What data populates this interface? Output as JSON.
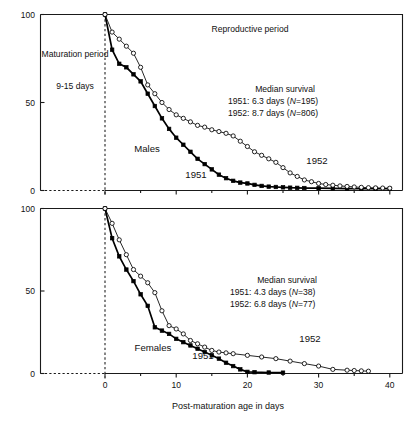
{
  "figure": {
    "x_axis_title": "Post-maturation age in days",
    "x_ticks": [
      "0",
      "10",
      "20",
      "30",
      "40"
    ],
    "y_ticks": [
      "100",
      "50",
      "0"
    ]
  },
  "panels": [
    {
      "id": "males",
      "sex_label": "Males",
      "region_left_label": "Maturation period",
      "region_left_sub": "9-15 days",
      "region_right_label": "Reproductive period",
      "stats_title": "Median survival",
      "stats_rows": [
        {
          "year": "1951:",
          "value": "6.3 days (",
          "n_italic": "N",
          "n_rest": "=195)"
        },
        {
          "year": "1952:",
          "value": "8.7 days (",
          "n_italic": "N",
          "n_rest": "=806)"
        }
      ],
      "curve_label_1951": "1951",
      "curve_label_1952": "1952"
    },
    {
      "id": "females",
      "sex_label": "Females",
      "stats_title": "Median survival",
      "stats_rows": [
        {
          "year": "1951:",
          "value": "4.3 days (",
          "n_italic": "N",
          "n_rest": "=38)"
        },
        {
          "year": "1952:",
          "value": "6.8 days (",
          "n_italic": "N",
          "n_rest": "=77)"
        }
      ],
      "curve_label_1951": "1951",
      "curve_label_1952": "1952"
    }
  ],
  "chart_data": {
    "type": "line",
    "xlabel": "Post-maturation age in days",
    "ylabel": "Percent surviving",
    "xlim": [
      -3,
      45
    ],
    "ylim": [
      0,
      100
    ],
    "grid": false,
    "legend": "inline-curve-labels",
    "panels": [
      {
        "name": "Males",
        "annotations": [
          "Maturation period 9-15 days",
          "Reproductive period",
          "Median survival 1951: 6.3 days (N=195)",
          "Median survival 1952: 8.7 days (N=806)"
        ],
        "median_survival": {
          "1951": 6.3,
          "1952": 8.7
        },
        "sample_size": {
          "1951": 195,
          "1952": 806
        },
        "series": [
          {
            "name": "1951",
            "marker": "filled-square",
            "x": [
              0,
              1,
              2,
              3,
              4,
              5,
              6,
              7,
              8,
              9,
              10,
              11,
              12,
              13,
              14,
              15,
              16,
              17,
              18,
              19,
              20,
              21,
              22,
              23,
              24,
              25,
              26,
              27,
              28,
              30,
              32,
              34,
              36,
              38,
              40,
              43
            ],
            "y": [
              100,
              80,
              72,
              70,
              66,
              62,
              55,
              48,
              41,
              35,
              30,
              26,
              22,
              18,
              15,
              12,
              9,
              7,
              5.5,
              4.5,
              4,
              3.2,
              2.6,
              2.2,
              2,
              1.8,
              1.6,
              1.5,
              1.4,
              1.3,
              1.2,
              1.1,
              1,
              1,
              1,
              1
            ]
          },
          {
            "name": "1952",
            "marker": "open-circle",
            "x": [
              0,
              1,
              2,
              3,
              4,
              5,
              6,
              7,
              8,
              9,
              10,
              11,
              12,
              13,
              14,
              15,
              16,
              17,
              18,
              19,
              20,
              21,
              22,
              23,
              24,
              25,
              26,
              27,
              28,
              29,
              30,
              31,
              32,
              33,
              34,
              35,
              36,
              37,
              38,
              39,
              40,
              42,
              44
            ],
            "y": [
              100,
              90,
              86,
              82,
              78,
              70,
              60,
              55,
              50,
              46,
              43,
              41,
              39,
              37,
              36,
              34.5,
              33.5,
              32.5,
              31,
              28,
              25,
              22,
              20,
              18,
              16,
              13,
              10,
              8,
              6,
              5,
              4,
              3.4,
              3,
              2.6,
              2.3,
              2,
              1.8,
              1.6,
              1.5,
              1.4,
              1.3,
              1.2,
              1.1
            ]
          }
        ]
      },
      {
        "name": "Females",
        "annotations": [
          "Median survival 1951: 4.3 days (N=38)",
          "Median survival 1952: 6.8 days (N=77)"
        ],
        "median_survival": {
          "1951": 4.3,
          "1952": 6.8
        },
        "sample_size": {
          "1951": 38,
          "1952": 77
        },
        "series": [
          {
            "name": "1951",
            "marker": "filled-square",
            "x": [
              0,
              1,
              2,
              3,
              4,
              5,
              6,
              7,
              8,
              9,
              10,
              11,
              12,
              13,
              14,
              15,
              16,
              17,
              18,
              19,
              20,
              21,
              23,
              25
            ],
            "y": [
              100,
              82,
              71,
              63,
              56,
              48,
              41,
              28,
              26,
              24,
              21,
              19,
              17,
              15,
              13,
              11,
              9,
              6.5,
              4.5,
              2.5,
              1,
              0.8,
              0.6,
              0.5
            ]
          },
          {
            "name": "1952",
            "marker": "open-circle",
            "x": [
              0,
              1,
              2,
              3,
              4,
              5,
              6,
              7,
              8,
              9,
              10,
              11,
              12,
              13,
              14,
              15,
              16,
              17,
              18,
              20,
              22,
              24,
              26,
              28,
              30,
              32,
              34,
              35,
              36,
              37
            ],
            "y": [
              100,
              91,
              81,
              72,
              63,
              59,
              55,
              49,
              38,
              29,
              27,
              24,
              20,
              18,
              16,
              14,
              13,
              12.5,
              12,
              11,
              10,
              9,
              7.5,
              6,
              4.5,
              2.5,
              2,
              1.8,
              1.6,
              1.4
            ]
          }
        ]
      }
    ]
  }
}
